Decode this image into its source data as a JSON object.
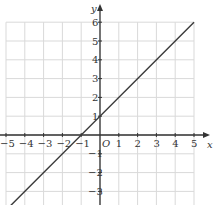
{
  "chart_data": {
    "type": "line",
    "title": "",
    "xlabel": "x",
    "ylabel": "y",
    "origin_label": "O",
    "xlim": [
      -5,
      5
    ],
    "ylim": [
      -4,
      6
    ],
    "grid": true,
    "x_ticks": [
      -5,
      -4,
      -3,
      -2,
      -1,
      1,
      2,
      3,
      4,
      5
    ],
    "x_tick_labels": [
      "−5",
      "−4",
      "−3",
      "−2",
      "−1",
      "1",
      "2",
      "3",
      "4",
      "5"
    ],
    "y_ticks": [
      6,
      5,
      4,
      3,
      2,
      1,
      -1,
      -2,
      -3,
      -4
    ],
    "y_tick_labels": [
      "6",
      "5",
      "4",
      "3",
      "2",
      "1",
      "−1",
      "−2",
      "−3",
      "−4"
    ],
    "series": [
      {
        "name": "y = x + 1",
        "x": [
          -5,
          5
        ],
        "y": [
          -4,
          6
        ],
        "color": "#3a3a3a"
      }
    ]
  },
  "colors": {
    "grid": "#d9d9d9",
    "axis": "#333333",
    "line": "#3a3a3a"
  }
}
